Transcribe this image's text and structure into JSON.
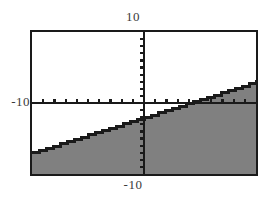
{
  "chart_data": {
    "type": "line",
    "title": "",
    "subtitle": "",
    "xlabel": "",
    "ylabel": "",
    "xlim": [
      -10,
      10
    ],
    "ylim": [
      -10,
      10
    ],
    "grid": false,
    "legend": false,
    "legend_position": "none",
    "axis_labels": {
      "top": "10",
      "bottom": "-10",
      "left": "-10"
    },
    "tick_labels": {
      "x": [
        "-10",
        "10"
      ],
      "y": [
        "-10",
        "10"
      ]
    },
    "x_tick_values": [
      -9,
      -8,
      -7,
      -6,
      -5,
      -4,
      -3,
      -2,
      -1,
      1,
      2,
      3,
      4,
      5,
      6,
      7,
      8,
      9
    ],
    "y_tick_values": [
      -9,
      -8,
      -7,
      -6,
      -5,
      -4,
      -3,
      -2,
      -1,
      1,
      2,
      3,
      4,
      5,
      6,
      7,
      8,
      9
    ],
    "series": [
      {
        "name": "boundary-line",
        "type": "line",
        "style": "solid",
        "color": "#1a1a1a",
        "equation": "y = 0.5x - 2",
        "slope": 0.5,
        "intercept": -2,
        "x": [
          -10,
          10
        ],
        "values": [
          -7,
          3
        ]
      }
    ],
    "shaded_region": {
      "name": "inequality-shading",
      "description": "region below the boundary line",
      "inequality": "y <= 0.5x - 2",
      "color": "#808080",
      "opacity": 1
    },
    "annotations": [],
    "colors": {
      "frame": "#1a1a1a",
      "axis": "#1a1a1a",
      "shading": "#808080",
      "background": "#ffffff",
      "label_text": "#3a3a3a"
    }
  }
}
